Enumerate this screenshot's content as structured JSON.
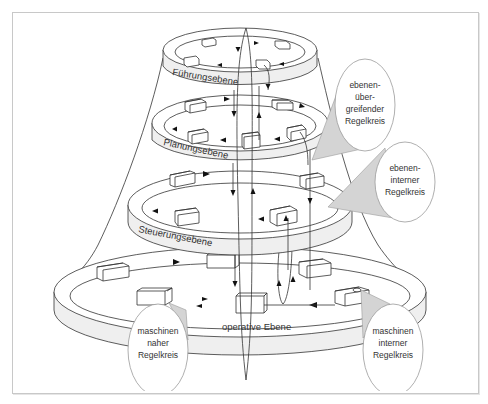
{
  "diagram": {
    "levels": [
      {
        "id": "fuehrung",
        "label": "Führungsebene"
      },
      {
        "id": "planung",
        "label": "Planungsebene"
      },
      {
        "id": "steuerung",
        "label": "Steuerungsebene"
      },
      {
        "id": "operativ",
        "label": "operative Ebene"
      }
    ],
    "callouts": [
      {
        "id": "ebenen-uebergreifend",
        "lines": [
          "ebenen-",
          "über-",
          "greifender",
          "Regelkreis"
        ]
      },
      {
        "id": "ebenen-intern",
        "lines": [
          "ebenen-",
          "interner",
          "Regelkreis"
        ]
      },
      {
        "id": "maschinen-nah",
        "lines": [
          "maschinen",
          "naher",
          "Regelkreis"
        ]
      },
      {
        "id": "maschinen-intern",
        "lines": [
          "maschinen",
          "interner",
          "Regelkreis"
        ]
      }
    ],
    "colors": {
      "stroke": "#333333",
      "band_fill": "#efefef",
      "callout_cone": "#d4d4d4",
      "callout_border": "#9a9a9a",
      "frame_border": "#c8c8c8"
    }
  }
}
